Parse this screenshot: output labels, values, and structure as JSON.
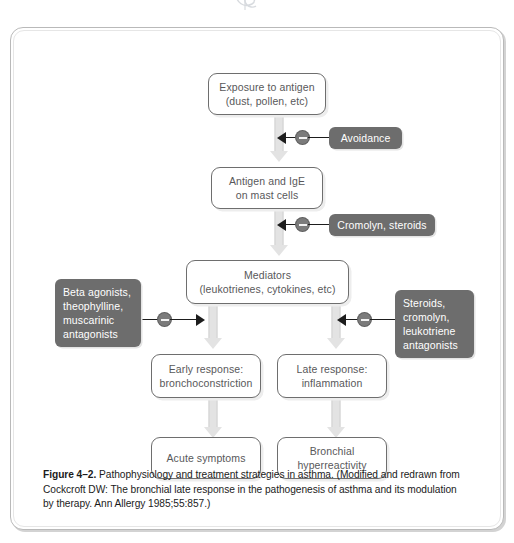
{
  "figure": {
    "glyph": "partial-logo-glyph",
    "caption_label": "Figure 4–2.",
    "caption_text": " Pathophysiology and treatment strategies in asthma. (Modified and redrawn from Cockcroft DW: The bronchial late response in the pathogenesis of asthma and its modulation by therapy. Ann Allergy 1985;55:857.)"
  },
  "colors": {
    "node_border": "#6e6e6e",
    "node_text": "#58585a",
    "drug_background": "#6d6d6d",
    "drug_text": "#ffffff",
    "flow_arrow": "#e3e3e3",
    "inhibitor_line": "#1d1d1d",
    "inhibitor_dot": "#7b7b7b",
    "frame_border": "#b9b9b9"
  },
  "nodes": [
    {
      "id": "exposure",
      "line1": "Exposure to antigen",
      "line2": "(dust, pollen, etc)"
    },
    {
      "id": "antigen-ige",
      "line1": "Antigen and IgE",
      "line2": "on mast cells"
    },
    {
      "id": "mediators",
      "line1": "Mediators",
      "line2": "(leukotrienes, cytokines, etc)"
    },
    {
      "id": "early-response",
      "line1": "Early response:",
      "line2": "bronchoconstriction"
    },
    {
      "id": "late-response",
      "line1": "Late response:",
      "line2": "inflammation"
    },
    {
      "id": "acute-symptoms",
      "line1": "Acute symptoms",
      "line2": ""
    },
    {
      "id": "bronchial-hyperreactivity",
      "line1": "Bronchial",
      "line2": "hyperreactivity"
    }
  ],
  "drugs": [
    {
      "id": "avoidance",
      "line1": "Avoidance",
      "line2": "",
      "line3": "",
      "line4": ""
    },
    {
      "id": "cromolyn-steroids",
      "line1": "Cromolyn, steroids",
      "line2": "",
      "line3": "",
      "line4": ""
    },
    {
      "id": "beta-agonists",
      "line1": "Beta agonists,",
      "line2": "theophylline,",
      "line3": "muscarinic",
      "line4": "antagonists"
    },
    {
      "id": "steroids-cromolyn",
      "line1": "Steroids,",
      "line2": "cromolyn,",
      "line3": "leukotriene",
      "line4": "antagonists"
    }
  ]
}
